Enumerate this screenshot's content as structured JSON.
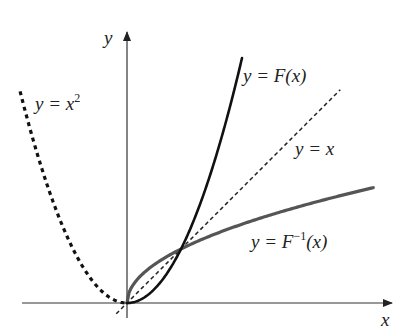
{
  "figure": {
    "width": 401,
    "height": 332,
    "background": "#ffffff"
  },
  "axes": {
    "origin_px": [
      127,
      303
    ],
    "unit_px": 54,
    "x_axis": {
      "label": "x",
      "from_px": 22,
      "to_px": 392,
      "color": "#333333"
    },
    "y_axis": {
      "label": "y",
      "from_px": 318,
      "to_px": 32,
      "color": "#333333"
    }
  },
  "curves": [
    {
      "id": "parabola-left",
      "name": "y = x^2",
      "label_parts": [
        "y = x",
        "2"
      ],
      "function": "x^2",
      "domain": [
        -1.98,
        0
      ],
      "style": "dotted-thick",
      "color": "#111111",
      "stroke_width": 3.2,
      "dash": "4 4"
    },
    {
      "id": "F",
      "name": "y = F(x)",
      "label_parts": [
        "y = F(x)"
      ],
      "function": "x^2",
      "domain": [
        0,
        2.13
      ],
      "style": "solid",
      "color": "#111111",
      "stroke_width": 2.6
    },
    {
      "id": "identity",
      "name": "y = x",
      "label_parts": [
        "y = x"
      ],
      "function": "x",
      "domain": [
        -0.2,
        3.95
      ],
      "style": "dashed",
      "color": "#222222",
      "stroke_width": 1.5,
      "dash": "4 3"
    },
    {
      "id": "F-inverse",
      "name": "y = F^{-1}(x)",
      "label_parts": [
        "y = F",
        "−1",
        "(x)"
      ],
      "function": "sqrt(x)",
      "domain": [
        0,
        4.56
      ],
      "style": "solid",
      "color": "#555555",
      "stroke_width": 3.2
    }
  ],
  "labels": {
    "y_axis": {
      "text": "y",
      "x": 104,
      "y": 44
    },
    "x_axis": {
      "text": "x",
      "x": 381,
      "y": 326
    },
    "parabola": {
      "main": "y = x",
      "sup": "2",
      "x": 35,
      "y": 110
    },
    "F": {
      "text": "y = F(x)",
      "x": 243,
      "y": 82
    },
    "identity": {
      "text": "y = x",
      "x": 295,
      "y": 155
    },
    "F_inverse": {
      "main": "y = F",
      "sup": "−1",
      "tail": "(x)",
      "x": 251,
      "y": 248
    }
  },
  "intersection_point": {
    "x": 1,
    "y": 1,
    "px": [
      181,
      248
    ]
  }
}
